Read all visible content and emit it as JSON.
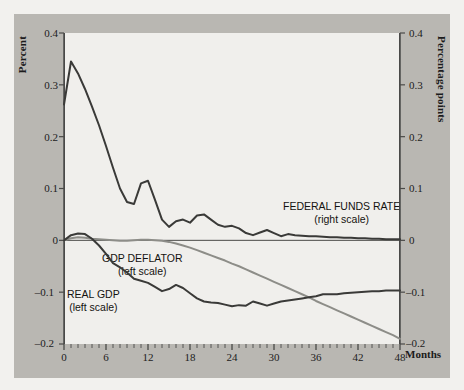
{
  "figure": {
    "background_color": "#f2f1ee",
    "panel_color": "#b9b7b2",
    "plot_background_color": "#f0efec"
  },
  "axes": {
    "left_title": "Percent",
    "right_title": "Percentage points",
    "x_title": "Months",
    "left_ticks": [
      "0.4",
      "0.3",
      "0.2",
      "0.1",
      "0",
      "–0.1",
      "–0.2"
    ],
    "right_ticks": [
      "0.4",
      "0.3",
      "0.2",
      "0.1",
      "0",
      "–0.1",
      "–0.2"
    ],
    "x_ticks": [
      "0",
      "6",
      "12",
      "18",
      "24",
      "30",
      "36",
      "42",
      "48"
    ]
  },
  "labels": {
    "federal_funds": {
      "title": "FEDERAL FUNDS RATE",
      "scale": "(right scale)"
    },
    "gdp_deflator": {
      "title": "GDP DEFLATOR",
      "scale": "(left scale)"
    },
    "real_gdp": {
      "title": "REAL GDP",
      "scale": "(left scale)"
    }
  },
  "chart_data": {
    "type": "line",
    "title": "",
    "xlabel": "Months",
    "ylabel": "Percent",
    "y2label": "Percentage points",
    "xlim": [
      0,
      48
    ],
    "ylim": [
      -0.2,
      0.4
    ],
    "y2lim": [
      -0.2,
      0.4
    ],
    "xticks": [
      0,
      6,
      12,
      18,
      24,
      30,
      36,
      42,
      48
    ],
    "yticks": [
      -0.2,
      -0.1,
      0,
      0.1,
      0.2,
      0.3,
      0.4
    ],
    "minor_xtick_interval": 1,
    "grid": false,
    "legend_position": "inline-annotations",
    "zero_line": true,
    "colors": {
      "federal_funds": "#3a3a38",
      "real_gdp": "#3a3a38",
      "gdp_deflator": "#8d8d88",
      "axis": "#4a4a48"
    },
    "x": [
      0,
      1,
      2,
      3,
      4,
      5,
      6,
      7,
      8,
      9,
      10,
      11,
      12,
      13,
      14,
      15,
      16,
      17,
      18,
      19,
      20,
      21,
      22,
      23,
      24,
      25,
      26,
      27,
      28,
      29,
      30,
      31,
      32,
      33,
      34,
      35,
      36,
      37,
      38,
      39,
      40,
      41,
      42,
      43,
      44,
      45,
      46,
      47,
      48
    ],
    "series": [
      {
        "name": "FEDERAL FUNDS RATE",
        "scale": "right",
        "color": "#3a3a38",
        "width": 2.0,
        "values": [
          0.262,
          0.345,
          0.322,
          0.292,
          0.258,
          0.222,
          0.182,
          0.14,
          0.1,
          0.074,
          0.07,
          0.11,
          0.115,
          0.078,
          0.04,
          0.026,
          0.037,
          0.04,
          0.034,
          0.048,
          0.05,
          0.04,
          0.03,
          0.026,
          0.028,
          0.023,
          0.014,
          0.01,
          0.015,
          0.02,
          0.014,
          0.008,
          0.012,
          0.01,
          0.009,
          0.008,
          0.008,
          0.007,
          0.006,
          0.006,
          0.005,
          0.005,
          0.004,
          0.004,
          0.003,
          0.003,
          0.002,
          0.002,
          0.002
        ]
      },
      {
        "name": "REAL GDP",
        "scale": "left",
        "color": "#3a3a38",
        "width": 2.0,
        "values": [
          0.0,
          0.01,
          0.013,
          0.012,
          0.003,
          -0.01,
          -0.026,
          -0.044,
          -0.052,
          -0.062,
          -0.074,
          -0.078,
          -0.082,
          -0.09,
          -0.098,
          -0.094,
          -0.086,
          -0.092,
          -0.102,
          -0.112,
          -0.118,
          -0.12,
          -0.121,
          -0.124,
          -0.127,
          -0.125,
          -0.126,
          -0.118,
          -0.122,
          -0.126,
          -0.122,
          -0.118,
          -0.116,
          -0.114,
          -0.112,
          -0.11,
          -0.108,
          -0.104,
          -0.104,
          -0.104,
          -0.102,
          -0.101,
          -0.1,
          -0.099,
          -0.098,
          -0.098,
          -0.097,
          -0.097,
          -0.097
        ]
      },
      {
        "name": "GDP DEFLATOR",
        "scale": "left",
        "color": "#8d8d88",
        "width": 2.0,
        "values": [
          0.0,
          0.004,
          0.006,
          0.005,
          0.003,
          0.002,
          0.001,
          0.0,
          -0.001,
          -0.001,
          0.0,
          0.001,
          0.001,
          0.0,
          -0.001,
          -0.003,
          -0.006,
          -0.01,
          -0.014,
          -0.019,
          -0.024,
          -0.029,
          -0.034,
          -0.039,
          -0.045,
          -0.05,
          -0.056,
          -0.062,
          -0.068,
          -0.074,
          -0.08,
          -0.086,
          -0.092,
          -0.098,
          -0.104,
          -0.11,
          -0.117,
          -0.123,
          -0.129,
          -0.135,
          -0.141,
          -0.147,
          -0.153,
          -0.159,
          -0.165,
          -0.171,
          -0.177,
          -0.183,
          -0.19
        ]
      }
    ]
  }
}
